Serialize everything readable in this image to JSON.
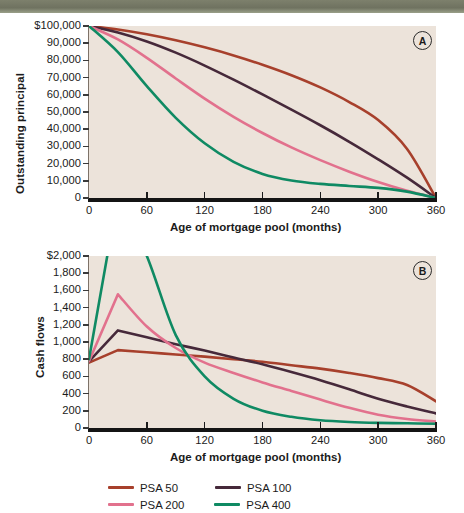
{
  "chart_data": [
    {
      "id": "A",
      "type": "line",
      "panel_label": "A",
      "title": "",
      "xlabel": "Age of mortgage pool (months)",
      "ylabel": "Outstanding principal",
      "xlim": [
        0,
        360
      ],
      "ylim": [
        0,
        100000
      ],
      "grid": false,
      "legend_position": "bottom",
      "xticks": [
        0,
        60,
        120,
        180,
        240,
        300,
        360
      ],
      "xticklabels": [
        "0",
        "60",
        "120",
        "180",
        "240",
        "300",
        "360"
      ],
      "yticks": [
        0,
        10000,
        20000,
        30000,
        40000,
        50000,
        60000,
        70000,
        80000,
        90000,
        100000
      ],
      "yticklabels": [
        "0",
        "10,000",
        "20,000",
        "30,000",
        "40,000",
        "50,000",
        "60,000",
        "70,000",
        "80,000",
        "90,000",
        "$100,000"
      ],
      "x": [
        0,
        30,
        60,
        90,
        120,
        150,
        180,
        210,
        240,
        270,
        300,
        330,
        360
      ],
      "series": [
        {
          "name": "PSA 50",
          "color": "#a7402c",
          "values": [
            100000,
            98000,
            95200,
            91700,
            87600,
            82900,
            77500,
            71400,
            64300,
            55800,
            45300,
            28500,
            0
          ]
        },
        {
          "name": "PSA 100",
          "color": "#46293a",
          "values": [
            100000,
            96200,
            91000,
            84500,
            77000,
            68800,
            60200,
            51400,
            42300,
            32700,
            22500,
            11800,
            0
          ]
        },
        {
          "name": "PSA 200",
          "color": "#e2718d",
          "values": [
            100000,
            92200,
            81500,
            69500,
            57800,
            47200,
            37800,
            29400,
            22000,
            15300,
            9300,
            4200,
            0
          ]
        },
        {
          "name": "PSA 400",
          "color": "#0f8a63",
          "values": [
            100000,
            84800,
            65000,
            46600,
            31800,
            21000,
            14000,
            10200,
            8200,
            7000,
            5900,
            3700,
            0
          ]
        }
      ]
    },
    {
      "id": "B",
      "type": "line",
      "panel_label": "B",
      "title": "",
      "xlabel": "Age of mortgage pool (months)",
      "ylabel": "Cash flows",
      "xlim": [
        0,
        360
      ],
      "ylim": [
        0,
        2000
      ],
      "grid": false,
      "legend_position": "bottom",
      "note": "PSA 400 series peaks above the 2,000 axis maximum and is clipped at the top of the plot",
      "xticks": [
        0,
        60,
        120,
        180,
        240,
        300,
        360
      ],
      "xticklabels": [
        "0",
        "60",
        "120",
        "180",
        "240",
        "300",
        "360"
      ],
      "yticks": [
        0,
        200,
        400,
        600,
        800,
        1000,
        1200,
        1400,
        1600,
        1800,
        2000
      ],
      "yticklabels": [
        "0",
        "200",
        "400",
        "600",
        "800",
        "1,000",
        "1,200",
        "1,400",
        "1,600",
        "1,800",
        "$2,000"
      ],
      "x": [
        0,
        30,
        60,
        90,
        120,
        150,
        180,
        210,
        240,
        270,
        300,
        330,
        360
      ],
      "series": [
        {
          "name": "PSA 50",
          "color": "#a7402c",
          "values": [
            760,
            905,
            880,
            855,
            830,
            800,
            770,
            730,
            690,
            640,
            580,
            500,
            310
          ]
        },
        {
          "name": "PSA 100",
          "color": "#46293a",
          "values": [
            775,
            1135,
            1055,
            975,
            900,
            820,
            740,
            650,
            555,
            450,
            340,
            250,
            170
          ]
        },
        {
          "name": "PSA 200",
          "color": "#e2718d",
          "values": [
            775,
            1555,
            1180,
            930,
            760,
            640,
            530,
            430,
            330,
            235,
            155,
            105,
            75
          ]
        },
        {
          "name": "PSA 400",
          "color": "#0f8a63",
          "values": [
            800,
            2700,
            2000,
            1080,
            600,
            340,
            200,
            130,
            90,
            70,
            60,
            55,
            50
          ]
        }
      ]
    }
  ],
  "legend": {
    "items": [
      {
        "label": "PSA 50",
        "color": "#a7402c"
      },
      {
        "label": "PSA 100",
        "color": "#46293a"
      },
      {
        "label": "PSA 200",
        "color": "#e2718d"
      },
      {
        "label": "PSA 400",
        "color": "#0f8a63"
      }
    ]
  },
  "colors": {
    "plot_background": "#ece3da",
    "page_background": "#ffffff",
    "axis": "#141414",
    "text": "#1b1b1b",
    "top_strip": "#7d806c"
  }
}
